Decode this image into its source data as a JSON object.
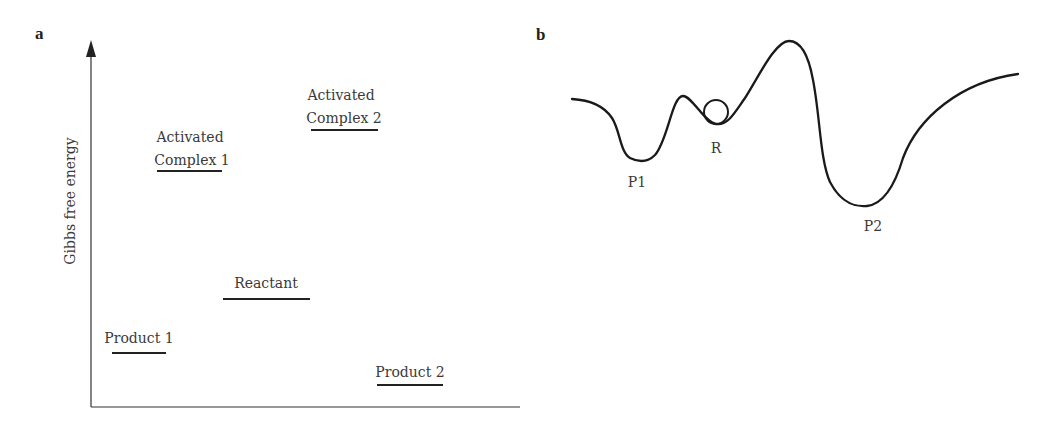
{
  "panel_a": {
    "panel_label": "a",
    "y_axis_label": "Gibbs free energy",
    "levels": [
      {
        "id": "activated-complex-1",
        "line1": "Activated",
        "line2": "Complex 1",
        "x1": 157,
        "x2": 222,
        "y": 171
      },
      {
        "id": "activated-complex-2",
        "line1": "Activated",
        "line2": "Complex 2",
        "x1": 311,
        "x2": 378,
        "y": 130
      },
      {
        "id": "reactant",
        "line1": "Reactant",
        "x1": 223,
        "x2": 310,
        "y": 299
      },
      {
        "id": "product-1",
        "line1": "Product 1",
        "x1": 112,
        "x2": 166,
        "y": 353
      },
      {
        "id": "product-2",
        "line1": "Product 2",
        "x1": 377,
        "x2": 443,
        "y": 385
      }
    ]
  },
  "panel_b": {
    "panel_label": "b",
    "labels": {
      "p1": "P1",
      "r": "R",
      "p2": "P2"
    }
  }
}
